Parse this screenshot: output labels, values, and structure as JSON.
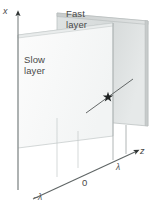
{
  "figure": {
    "type": "diagram",
    "axes": {
      "vertical": {
        "label": "x",
        "name": "x-axis"
      },
      "depth": {
        "label": "z",
        "name": "z-axis"
      }
    },
    "ticks": [
      {
        "label": "−λ",
        "name": "tick-minus-lambda"
      },
      {
        "label": "0",
        "name": "tick-zero"
      },
      {
        "label": "λ",
        "name": "tick-lambda"
      }
    ],
    "planes": [
      {
        "name": "fast-layer",
        "label_line1": "Fast",
        "label_line2": "layer",
        "fill": "#d8dcdc"
      },
      {
        "name": "slow-layer",
        "label_line1": "Slow",
        "label_line2": "layer",
        "fill": "#f7f8f8"
      }
    ],
    "marker": {
      "name": "star-marker",
      "glyph": "✶"
    },
    "colors": {
      "background": "#ffffff",
      "fast_fill": "#d8dcdc",
      "slow_fill": "#f8f9f9",
      "edge": "#9aa0a0",
      "axis": "#6e7474",
      "text": "#4a4a4a",
      "ray": "#3a3a3a"
    }
  }
}
